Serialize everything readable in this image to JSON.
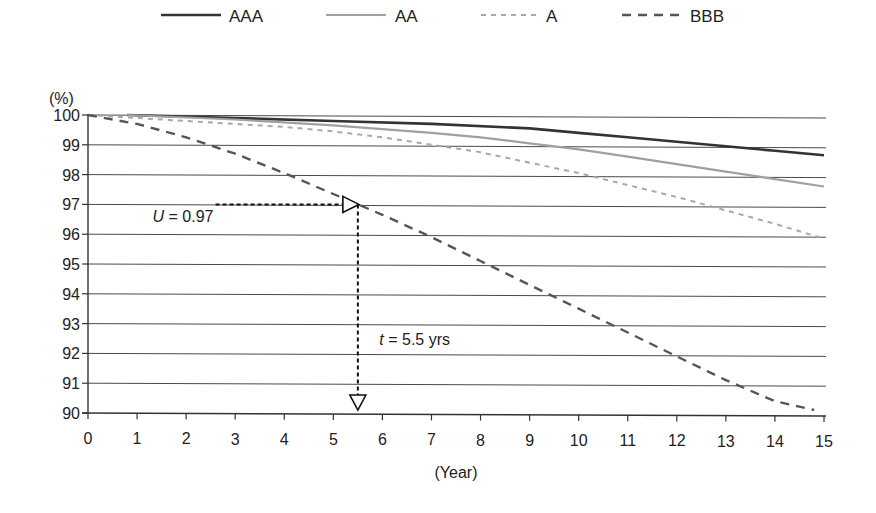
{
  "chart_data": {
    "type": "line",
    "title": "",
    "xlabel": "(Year)",
    "ylabel": "(%)",
    "xlim": [
      0,
      15
    ],
    "ylim": [
      90,
      100
    ],
    "x_ticks": [
      "0",
      "1",
      "2",
      "3",
      "4",
      "5",
      "6",
      "7",
      "8",
      "9",
      "10",
      "11",
      "12",
      "13",
      "14",
      "15"
    ],
    "y_ticks": [
      "90",
      "91",
      "92",
      "93",
      "94",
      "95",
      "96",
      "97",
      "98",
      "99",
      "100"
    ],
    "grid": "horizontal",
    "legend_position": "top",
    "series": [
      {
        "name": "AAA",
        "style": "solid-dark",
        "color": "#333333",
        "x": [
          0.8,
          3,
          5,
          7,
          9,
          10,
          11,
          12,
          13,
          14,
          15
        ],
        "y": [
          100.0,
          99.9,
          99.8,
          99.7,
          99.55,
          99.4,
          99.25,
          99.1,
          98.95,
          98.8,
          98.65
        ]
      },
      {
        "name": "AA",
        "style": "solid-light",
        "color": "#a0a0a0",
        "x": [
          0.8,
          3,
          5,
          7,
          8,
          9,
          10,
          11,
          12,
          13,
          14,
          15
        ],
        "y": [
          100.0,
          99.85,
          99.65,
          99.4,
          99.25,
          99.05,
          98.85,
          98.6,
          98.35,
          98.1,
          97.85,
          97.6
        ]
      },
      {
        "name": "A",
        "style": "dotted-light",
        "color": "#a8a8a8",
        "x": [
          0,
          2,
          4,
          5,
          6,
          7,
          8,
          9,
          10,
          11,
          12,
          13,
          14,
          15
        ],
        "y": [
          100.0,
          99.8,
          99.6,
          99.45,
          99.25,
          99.0,
          98.75,
          98.4,
          98.05,
          97.65,
          97.25,
          96.8,
          96.35,
          95.85
        ]
      },
      {
        "name": "BBB",
        "style": "dashed-dark",
        "color": "#555555",
        "x": [
          0,
          1,
          2,
          3,
          4,
          5,
          5.5,
          6,
          7,
          8,
          9,
          10,
          11,
          12,
          13,
          14,
          14.8
        ],
        "y": [
          100.0,
          99.7,
          99.25,
          98.7,
          98.05,
          97.35,
          97.0,
          96.65,
          95.9,
          95.1,
          94.3,
          93.5,
          92.7,
          91.9,
          91.1,
          90.4,
          90.1
        ]
      }
    ],
    "annotations": [
      {
        "id": "u-label",
        "text_var": "U",
        "text_rest": " = 0.97",
        "x": 2.6,
        "y": 96.7
      },
      {
        "id": "t-label",
        "text_var": "t",
        "text_rest": " = 5.5 yrs",
        "x": 6.1,
        "y": 92.6
      },
      {
        "id": "u-arrow",
        "kind": "horizontal-dashed-arrow",
        "from": [
          2.6,
          97.0
        ],
        "to": [
          5.5,
          97.0
        ]
      },
      {
        "id": "t-arrow",
        "kind": "vertical-dashed-arrow",
        "from": [
          5.5,
          97.0
        ],
        "to": [
          5.5,
          90.3
        ]
      }
    ]
  }
}
